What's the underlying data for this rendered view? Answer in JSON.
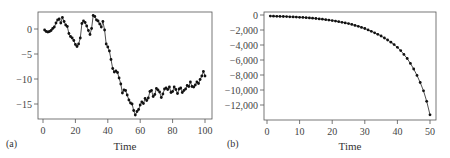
{
  "chart_data": [
    {
      "type": "line",
      "panel_label": "(a)",
      "title": "",
      "xlabel": "Time",
      "ylabel": "",
      "xlim": [
        -3,
        104
      ],
      "ylim": [
        -18,
        3.4
      ],
      "xticks": [
        0,
        20,
        40,
        60,
        80,
        100
      ],
      "yticks": [
        0,
        -5,
        -10,
        -15
      ],
      "ytick_labels": [
        "0",
        "−5",
        "−10",
        "−15"
      ],
      "grid": false,
      "markers": true,
      "x": [
        1,
        2,
        3,
        4,
        5,
        6,
        7,
        8,
        9,
        10,
        11,
        12,
        13,
        14,
        15,
        16,
        17,
        18,
        19,
        20,
        21,
        22,
        23,
        24,
        25,
        26,
        27,
        28,
        29,
        30,
        31,
        32,
        33,
        34,
        35,
        36,
        37,
        38,
        39,
        40,
        41,
        42,
        43,
        44,
        45,
        46,
        47,
        48,
        49,
        50,
        51,
        52,
        53,
        54,
        55,
        56,
        57,
        58,
        59,
        60,
        61,
        62,
        63,
        64,
        65,
        66,
        67,
        68,
        69,
        70,
        71,
        72,
        73,
        74,
        75,
        76,
        77,
        78,
        79,
        80,
        81,
        82,
        83,
        84,
        85,
        86,
        87,
        88,
        89,
        90,
        91,
        92,
        93,
        94,
        95,
        96,
        97,
        98,
        99,
        100
      ],
      "values": [
        -0.2,
        -0.5,
        -0.6,
        -0.5,
        -0.3,
        0.1,
        0.4,
        1.2,
        1.8,
        2.0,
        1.2,
        2.3,
        1.5,
        0.8,
        0.5,
        -0.9,
        -1.5,
        -1.8,
        -2.3,
        -3.1,
        -3.5,
        -3.0,
        -1.8,
        1.1,
        1.6,
        1.3,
        0.6,
        -0.3,
        -1.1,
        0.1,
        2.7,
        2.5,
        1.8,
        1.6,
        1.0,
        0.4,
        1.5,
        -0.2,
        -3.0,
        -3.6,
        -4.4,
        -6.1,
        -7.9,
        -8.6,
        -8.4,
        -8.7,
        -9.8,
        -11.0,
        -12.8,
        -12.2,
        -12.3,
        -13.2,
        -14.2,
        -14.8,
        -15.0,
        -16.3,
        -17.2,
        -16.5,
        -16.1,
        -15.2,
        -14.6,
        -14.9,
        -13.9,
        -14.3,
        -13.8,
        -12.5,
        -12.3,
        -13.5,
        -13.1,
        -11.9,
        -12.2,
        -12.6,
        -13.7,
        -13.0,
        -12.0,
        -11.8,
        -12.1,
        -11.6,
        -12.7,
        -12.5,
        -11.6,
        -12.1,
        -12.9,
        -12.0,
        -11.8,
        -12.7,
        -12.3,
        -12.0,
        -11.3,
        -11.5,
        -10.6,
        -11.5,
        -11.6,
        -11.2,
        -10.6,
        -10.9,
        -10.1,
        -9.4,
        -8.5,
        -9.4
      ]
    },
    {
      "type": "line",
      "panel_label": "(b)",
      "title": "",
      "xlabel": "Time",
      "ylabel": "",
      "xlim": [
        -1,
        51.5
      ],
      "ylim": [
        -14000,
        400
      ],
      "xticks": [
        0,
        10,
        20,
        30,
        40,
        50
      ],
      "yticks": [
        0,
        -2000,
        -4000,
        -6000,
        -8000,
        -10000,
        -12000
      ],
      "ytick_labels": [
        "0",
        "−2,000",
        "−4,000",
        "−6,000",
        "−8,000",
        "−10,000",
        "−12,000"
      ],
      "grid": false,
      "markers": true,
      "x": [
        1,
        2,
        3,
        4,
        5,
        6,
        7,
        8,
        9,
        10,
        11,
        12,
        13,
        14,
        15,
        16,
        17,
        18,
        19,
        20,
        21,
        22,
        23,
        24,
        25,
        26,
        27,
        28,
        29,
        30,
        31,
        32,
        33,
        34,
        35,
        36,
        37,
        38,
        39,
        40,
        41,
        42,
        43,
        44,
        45,
        46,
        47,
        48,
        49,
        50
      ],
      "values": [
        -150,
        -160,
        -170,
        -185,
        -200,
        -215,
        -235,
        -255,
        -275,
        -300,
        -325,
        -355,
        -385,
        -425,
        -470,
        -515,
        -565,
        -625,
        -685,
        -750,
        -820,
        -895,
        -975,
        -1060,
        -1150,
        -1260,
        -1380,
        -1510,
        -1650,
        -1800,
        -1980,
        -2170,
        -2370,
        -2580,
        -2800,
        -3060,
        -3330,
        -3630,
        -3950,
        -4300,
        -4750,
        -5250,
        -5800,
        -6450,
        -7200,
        -8050,
        -9000,
        -10100,
        -11500,
        -13300
      ]
    }
  ]
}
